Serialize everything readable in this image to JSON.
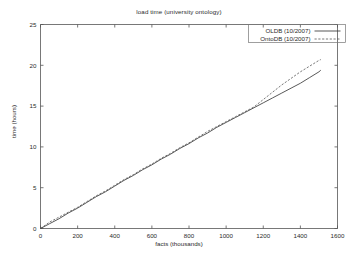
{
  "chart_data": {
    "type": "line",
    "title": "load time (university ontology)",
    "xlabel": "facts (thousands)",
    "ylabel": "time (hours)",
    "xlim": [
      0,
      1600
    ],
    "ylim": [
      0,
      25
    ],
    "xticks": [
      0,
      200,
      400,
      600,
      800,
      1000,
      1200,
      1400,
      1600
    ],
    "yticks": [
      0,
      5,
      10,
      15,
      20,
      25
    ],
    "xtick_labels": [
      "0",
      "200",
      "400",
      "600",
      "800",
      "1000",
      "1200",
      "1400",
      "1600"
    ],
    "ytick_labels": [
      "0",
      "5",
      "10",
      "15",
      "20",
      "25"
    ],
    "grid": false,
    "legend_position": "top-right",
    "series": [
      {
        "name": "OLDB (10/2007)",
        "style": "solid",
        "color": "#3a3a3a",
        "x": [
          0,
          50,
          100,
          150,
          200,
          250,
          300,
          350,
          400,
          450,
          500,
          550,
          600,
          650,
          700,
          750,
          800,
          850,
          900,
          950,
          1000,
          1050,
          1100,
          1150,
          1200,
          1250,
          1300,
          1350,
          1400,
          1450,
          1500,
          1510
        ],
        "y": [
          0.0,
          0.6,
          1.2,
          1.9,
          2.5,
          3.2,
          3.9,
          4.5,
          5.2,
          5.9,
          6.5,
          7.2,
          7.8,
          8.5,
          9.1,
          9.8,
          10.4,
          11.1,
          11.7,
          12.4,
          13.0,
          13.6,
          14.2,
          14.8,
          15.4,
          16.0,
          16.6,
          17.2,
          17.8,
          18.5,
          19.2,
          19.4
        ]
      },
      {
        "name": "OntoDB (10/2007)",
        "style": "dashed",
        "color": "#555555",
        "x": [
          0,
          50,
          100,
          150,
          200,
          250,
          300,
          350,
          400,
          450,
          500,
          550,
          600,
          650,
          700,
          750,
          800,
          850,
          900,
          950,
          1000,
          1050,
          1100,
          1150,
          1200,
          1250,
          1300,
          1350,
          1400,
          1450,
          1500,
          1510
        ],
        "y": [
          0.0,
          0.8,
          1.4,
          2.0,
          2.6,
          3.3,
          4.0,
          4.6,
          5.3,
          6.0,
          6.6,
          7.3,
          7.9,
          8.6,
          9.2,
          9.9,
          10.5,
          11.2,
          11.9,
          12.5,
          13.1,
          13.7,
          14.3,
          14.9,
          15.8,
          16.7,
          17.6,
          18.4,
          19.2,
          19.9,
          20.6,
          20.7
        ]
      }
    ]
  },
  "legend": {
    "entries": [
      {
        "label": "OLDB (10/2007)",
        "style": "solid"
      },
      {
        "label": "OntoDB (10/2007)",
        "style": "dashed"
      }
    ]
  }
}
